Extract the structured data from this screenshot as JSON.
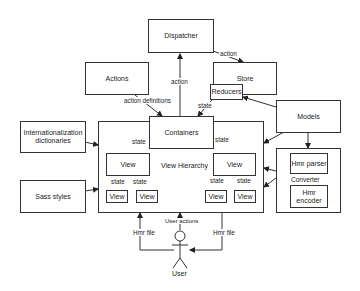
{
  "nodes": {
    "dispatcher": "Dispatcher",
    "actions": "Actions",
    "store": "Store",
    "reducers": "Reducers",
    "models": "Models",
    "i18n": "Internationalization dictionaries",
    "containers": "Containers",
    "view_hierarchy": "View Hierarchy",
    "view_left": "View",
    "view_right": "View",
    "view_ll": "View",
    "view_lr": "View",
    "view_rl": "View",
    "view_rr": "View",
    "sass": "Sass styles",
    "converter": "Converter",
    "hmr_parser": "Hmr parser",
    "hmr_encoder": "Hmr encoder",
    "user": "User"
  },
  "edges": {
    "dispatcher_store": "action",
    "containers_dispatcher": "action",
    "actions_containers": "action definitions",
    "reducers_containers": "state",
    "containers_view_left": "state",
    "containers_view_right": "state",
    "view_left_ll": "state",
    "view_left_lr": "state",
    "view_right_rl": "state",
    "view_right_rr": "state",
    "user_actions": "User actions",
    "hmr_in": "Hmr file",
    "hmr_out": "Hmr file"
  }
}
